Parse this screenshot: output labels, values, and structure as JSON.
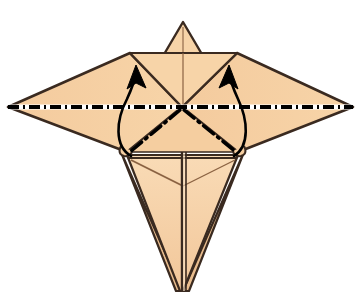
{
  "figure": {
    "canvas": {
      "width": 362,
      "height": 293
    },
    "background_color": "#ffffff"
  },
  "palette": {
    "paper_fill": "#F6CFA2",
    "paper_fill_shadow": "#EFC193",
    "paper_fill_light": "#F9DBB6",
    "edge_stroke": "#3A2A20",
    "crease_stroke": "#8A6242",
    "fold_line_stroke": "#000000",
    "arrow_stroke": "#000000",
    "highlight_white": "#FFFFFF"
  },
  "geometry": {
    "center_point": {
      "x": 182,
      "y": 107
    },
    "left_wing_tip": {
      "x": 8,
      "y": 107
    },
    "right_wing_tip": {
      "x": 353,
      "y": 107
    },
    "left_shoulder": {
      "x": 130,
      "y": 53
    },
    "right_shoulder": {
      "x": 237,
      "y": 53
    },
    "top_point_apex": {
      "x": 183,
      "y": 22
    },
    "bottom_point_tip": {
      "x": 182,
      "y": 291
    },
    "left_lower_corner": {
      "x": 127,
      "y": 152
    },
    "right_lower_corner": {
      "x": 238,
      "y": 152
    }
  },
  "annotations": {
    "mountain_fold_label": "mountain-fold-line",
    "valley_fold_label": "valley-fold-line",
    "arrows": [
      {
        "name": "left-fold-arrow",
        "direction": "up-left-curve",
        "tail": {
          "x": 133,
          "y": 155
        },
        "head": {
          "x": 136,
          "y": 68
        }
      },
      {
        "name": "right-fold-arrow",
        "direction": "up-right-curve",
        "tail": {
          "x": 233,
          "y": 155
        },
        "head": {
          "x": 230,
          "y": 68
        }
      }
    ],
    "dash_dot_creases": [
      {
        "name": "center-to-lower-left-crease",
        "from": {
          "x": 180,
          "y": 110
        },
        "to": {
          "x": 130,
          "y": 152
        }
      },
      {
        "name": "center-to-lower-right-crease",
        "from": {
          "x": 184,
          "y": 110
        },
        "to": {
          "x": 236,
          "y": 152
        }
      }
    ],
    "horizontal_fold": {
      "name": "horizontal-mountain-fold",
      "from": {
        "x": 8,
        "y": 107
      },
      "to": {
        "x": 353,
        "y": 107
      }
    }
  }
}
